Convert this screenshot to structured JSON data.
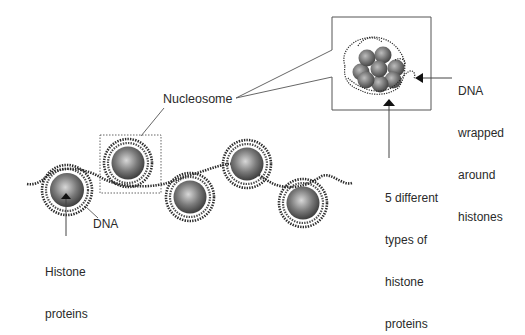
{
  "diagram": {
    "title": "",
    "labels": {
      "nucleosome": "Nucleosome",
      "dna": "DNA",
      "histone_proteins": [
        "Histone",
        "proteins"
      ],
      "dna_wrapped": [
        "DNA",
        "wrapped",
        "around",
        "histones"
      ],
      "five_types": [
        "5 different",
        "types of",
        "histone",
        "proteins"
      ]
    },
    "nucleosomes": [
      {
        "cx": 67,
        "cy": 190
      },
      {
        "cx": 128,
        "cy": 163
      },
      {
        "cx": 190,
        "cy": 197
      },
      {
        "cx": 247,
        "cy": 164
      },
      {
        "cx": 303,
        "cy": 203
      }
    ],
    "colors": {
      "sphere_light": "#d8d8d8",
      "sphere_dark": "#3a3a3a",
      "dna": "#2b2b2b",
      "line": "#555555"
    }
  }
}
